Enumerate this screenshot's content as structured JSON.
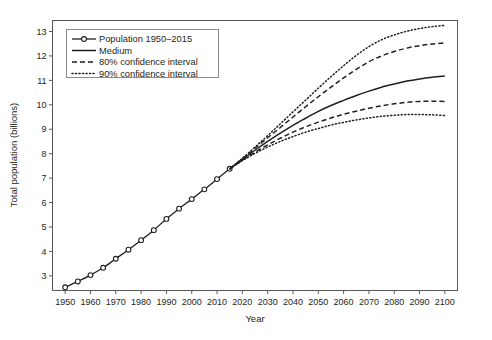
{
  "chart_data": {
    "type": "line",
    "title": "",
    "xlabel": "Year",
    "ylabel": "Total population (billions)",
    "xlim": [
      1945,
      2105
    ],
    "ylim": [
      2.4,
      13.45
    ],
    "grid": false,
    "legend_position": "upper-left-inside",
    "xticks": [
      1950,
      1960,
      1970,
      1980,
      1990,
      2000,
      2010,
      2020,
      2030,
      2040,
      2050,
      2060,
      2070,
      2080,
      2090,
      2100
    ],
    "yticks": [
      3,
      4,
      5,
      6,
      7,
      8,
      9,
      10,
      11,
      12,
      13
    ],
    "series": [
      {
        "name": "Population 1950-2015",
        "style": "solid-with-open-circle-markers",
        "x": [
          1950,
          1955,
          1960,
          1965,
          1970,
          1975,
          1980,
          1985,
          1990,
          1995,
          2000,
          2005,
          2010,
          2015
        ],
        "values": [
          2.53,
          2.77,
          3.03,
          3.33,
          3.7,
          4.07,
          4.46,
          4.87,
          5.33,
          5.75,
          6.14,
          6.54,
          6.96,
          7.38
        ]
      },
      {
        "name": "Medium",
        "style": "solid",
        "x": [
          2015,
          2020,
          2025,
          2030,
          2035,
          2040,
          2045,
          2050,
          2055,
          2060,
          2065,
          2070,
          2075,
          2080,
          2085,
          2090,
          2095,
          2100
        ],
        "values": [
          7.38,
          7.76,
          8.14,
          8.5,
          8.84,
          9.16,
          9.45,
          9.73,
          9.97,
          10.18,
          10.38,
          10.56,
          10.72,
          10.85,
          10.97,
          11.06,
          11.13,
          11.18
        ]
      },
      {
        "name": "80% confidence interval",
        "style": "dashed",
        "bound": "upper",
        "x": [
          2015,
          2020,
          2025,
          2030,
          2035,
          2040,
          2045,
          2050,
          2055,
          2060,
          2065,
          2070,
          2075,
          2080,
          2085,
          2090,
          2095,
          2100
        ],
        "values": [
          7.38,
          7.79,
          8.22,
          8.65,
          9.07,
          9.5,
          9.92,
          10.33,
          10.72,
          11.1,
          11.45,
          11.76,
          12.0,
          12.18,
          12.32,
          12.42,
          12.49,
          12.53
        ]
      },
      {
        "name": "80% confidence interval",
        "style": "dashed",
        "bound": "lower",
        "x": [
          2015,
          2020,
          2025,
          2030,
          2035,
          2040,
          2045,
          2050,
          2055,
          2060,
          2065,
          2070,
          2075,
          2080,
          2085,
          2090,
          2095,
          2100
        ],
        "values": [
          7.38,
          7.73,
          8.06,
          8.36,
          8.63,
          8.88,
          9.1,
          9.29,
          9.46,
          9.61,
          9.74,
          9.86,
          9.96,
          10.04,
          10.1,
          10.14,
          10.15,
          10.13
        ]
      },
      {
        "name": "90% confidence interval",
        "style": "dotted",
        "bound": "upper",
        "x": [
          2015,
          2020,
          2025,
          2030,
          2035,
          2040,
          2045,
          2050,
          2055,
          2060,
          2065,
          2070,
          2075,
          2080,
          2085,
          2090,
          2095,
          2100
        ],
        "values": [
          7.38,
          7.81,
          8.27,
          8.74,
          9.22,
          9.71,
          10.19,
          10.68,
          11.15,
          11.6,
          12.02,
          12.38,
          12.66,
          12.86,
          13.01,
          13.12,
          13.2,
          13.25
        ]
      },
      {
        "name": "90% confidence interval",
        "style": "dotted",
        "bound": "lower",
        "x": [
          2015,
          2020,
          2025,
          2030,
          2035,
          2040,
          2045,
          2050,
          2055,
          2060,
          2065,
          2070,
          2075,
          2080,
          2085,
          2090,
          2095,
          2100
        ],
        "values": [
          7.38,
          7.71,
          8.01,
          8.27,
          8.5,
          8.7,
          8.88,
          9.03,
          9.17,
          9.28,
          9.38,
          9.46,
          9.53,
          9.57,
          9.6,
          9.6,
          9.59,
          9.56
        ]
      }
    ],
    "legend_entries": [
      {
        "label": "Population 1950–2015",
        "style": "solid-marker"
      },
      {
        "label": "Medium",
        "style": "solid"
      },
      {
        "label": "80% confidence interval",
        "style": "dashed"
      },
      {
        "label": "90% confidence interval",
        "style": "dotted"
      }
    ]
  },
  "colors": {
    "line": "#231f20",
    "axis": "#58595b",
    "text": "#231f20",
    "background": "#ffffff",
    "legend_border": "#8b8c8e"
  }
}
